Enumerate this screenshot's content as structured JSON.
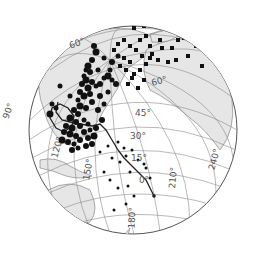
{
  "map": {
    "projection": "orthographic",
    "colors": {
      "background": "#ffffff",
      "ocean": "#ffffff",
      "land": "#e6e6e6",
      "coast": "#777777",
      "graticule": "#8a8a8a",
      "rim": "#555555",
      "points": "#111111",
      "track": "#222222",
      "label": "#555555"
    },
    "latitude_labels": [
      {
        "text": "60°",
        "x": 78,
        "y": 46,
        "rot": -20
      },
      {
        "text": "60°",
        "x": 160,
        "y": 84,
        "rot": -15
      },
      {
        "text": "45°",
        "x": 143,
        "y": 116,
        "rot": 0
      },
      {
        "text": "30°",
        "x": 138,
        "y": 139,
        "rot": 0
      },
      {
        "text": "15°",
        "x": 139,
        "y": 161,
        "rot": 0
      },
      {
        "text": "0°",
        "x": 144,
        "y": 183,
        "rot": 0
      }
    ],
    "longitude_labels": [
      {
        "text": "90°",
        "x": 11,
        "y": 112,
        "rot": -70
      },
      {
        "text": "120°",
        "x": 60,
        "y": 148,
        "rot": -75
      },
      {
        "text": "150°",
        "x": 91,
        "y": 170,
        "rot": -80
      },
      {
        "text": "180°",
        "x": 135,
        "y": 218,
        "rot": -88
      },
      {
        "text": "210°",
        "x": 176,
        "y": 178,
        "rot": -85
      },
      {
        "text": "240°",
        "x": 217,
        "y": 160,
        "rot": -75
      }
    ],
    "circle_points": [
      [
        94,
        46,
        3
      ],
      [
        96,
        52,
        3.5
      ],
      [
        92,
        60,
        3
      ],
      [
        88,
        66,
        3.5
      ],
      [
        86,
        70,
        2.5
      ],
      [
        90,
        72,
        3
      ],
      [
        84,
        76,
        2.5
      ],
      [
        86,
        80,
        3.5
      ],
      [
        92,
        82,
        3
      ],
      [
        82,
        84,
        3
      ],
      [
        88,
        88,
        3.5
      ],
      [
        96,
        86,
        2.5
      ],
      [
        80,
        92,
        3
      ],
      [
        84,
        96,
        3.5
      ],
      [
        90,
        94,
        3
      ],
      [
        92,
        102,
        3
      ],
      [
        78,
        100,
        2.5
      ],
      [
        80,
        106,
        3.5
      ],
      [
        86,
        108,
        3
      ],
      [
        74,
        110,
        3
      ],
      [
        78,
        114,
        3
      ],
      [
        70,
        118,
        3.5
      ],
      [
        76,
        122,
        3
      ],
      [
        84,
        120,
        2.5
      ],
      [
        66,
        126,
        3
      ],
      [
        72,
        128,
        3.5
      ],
      [
        80,
        126,
        3
      ],
      [
        88,
        124,
        2.5
      ],
      [
        64,
        132,
        3
      ],
      [
        70,
        134,
        3.5
      ],
      [
        76,
        136,
        3
      ],
      [
        84,
        132,
        3
      ],
      [
        90,
        130,
        2.5
      ],
      [
        96,
        128,
        3
      ],
      [
        62,
        140,
        3.5
      ],
      [
        68,
        142,
        3
      ],
      [
        74,
        144,
        2.5
      ],
      [
        80,
        140,
        3
      ],
      [
        88,
        138,
        3
      ],
      [
        94,
        136,
        3.5
      ],
      [
        72,
        150,
        3
      ],
      [
        78,
        148,
        2.5
      ],
      [
        86,
        146,
        3
      ],
      [
        92,
        144,
        3
      ],
      [
        52,
        104,
        2.5
      ],
      [
        50,
        114,
        3.5
      ],
      [
        56,
        108,
        2.5
      ],
      [
        100,
        84,
        3
      ],
      [
        104,
        78,
        2.5
      ],
      [
        108,
        76,
        3.5
      ],
      [
        112,
        80,
        2.5
      ],
      [
        116,
        84,
        3
      ],
      [
        108,
        92,
        2.5
      ],
      [
        100,
        96,
        3
      ],
      [
        104,
        104,
        2.5
      ],
      [
        98,
        110,
        3
      ],
      [
        110,
        70,
        2.5
      ],
      [
        112,
        62,
        3
      ],
      [
        118,
        56,
        2.5
      ],
      [
        104,
        58,
        2.5
      ],
      [
        60,
        86,
        2.5
      ],
      [
        98,
        70,
        2.5
      ],
      [
        70,
        96,
        2.5
      ],
      [
        102,
        120,
        3
      ]
    ],
    "square_points": [
      [
        136,
        20
      ],
      [
        140,
        24
      ],
      [
        134,
        28
      ],
      [
        144,
        26
      ],
      [
        168,
        22
      ],
      [
        178,
        40
      ],
      [
        184,
        38
      ],
      [
        172,
        48
      ],
      [
        196,
        46
      ],
      [
        200,
        42
      ],
      [
        142,
        56
      ],
      [
        150,
        58
      ],
      [
        158,
        60
      ],
      [
        168,
        62
      ],
      [
        176,
        60
      ],
      [
        188,
        56
      ],
      [
        202,
        66
      ],
      [
        124,
        58
      ],
      [
        130,
        62
      ],
      [
        126,
        70
      ],
      [
        134,
        74
      ],
      [
        140,
        70
      ],
      [
        144,
        80
      ],
      [
        138,
        88
      ],
      [
        128,
        84
      ],
      [
        132,
        78
      ],
      [
        146,
        64
      ],
      [
        152,
        54
      ],
      [
        118,
        44
      ],
      [
        124,
        40
      ],
      [
        162,
        48
      ],
      [
        160,
        40
      ],
      [
        130,
        46
      ],
      [
        136,
        50
      ],
      [
        150,
        46
      ],
      [
        114,
        50
      ],
      [
        120,
        66
      ],
      [
        140,
        40
      ],
      [
        146,
        36
      ],
      [
        212,
        30
      ]
    ],
    "small_points": [
      [
        118,
        142
      ],
      [
        124,
        148
      ],
      [
        132,
        150
      ],
      [
        126,
        156
      ],
      [
        138,
        160
      ],
      [
        144,
        164
      ],
      [
        112,
        158
      ],
      [
        120,
        162
      ],
      [
        130,
        172
      ],
      [
        146,
        168
      ],
      [
        150,
        178
      ],
      [
        104,
        172
      ],
      [
        110,
        180
      ],
      [
        118,
        188
      ],
      [
        128,
        186
      ],
      [
        134,
        196
      ],
      [
        126,
        204
      ],
      [
        114,
        210
      ],
      [
        108,
        146
      ],
      [
        100,
        152
      ]
    ],
    "track": [
      [
        58,
        102
      ],
      [
        56,
        112
      ],
      [
        62,
        120
      ],
      [
        70,
        122
      ],
      [
        80,
        124
      ],
      [
        92,
        126
      ],
      [
        100,
        124
      ],
      [
        106,
        130
      ],
      [
        112,
        140
      ],
      [
        118,
        150
      ],
      [
        124,
        158
      ],
      [
        132,
        166
      ],
      [
        140,
        174
      ],
      [
        146,
        180
      ],
      [
        150,
        188
      ],
      [
        154,
        196
      ]
    ],
    "loop_track": [
      [
        56,
        128
      ],
      [
        50,
        118
      ],
      [
        52,
        108
      ],
      [
        60,
        104
      ],
      [
        68,
        108
      ],
      [
        74,
        116
      ],
      [
        72,
        126
      ],
      [
        64,
        132
      ],
      [
        56,
        128
      ]
    ]
  }
}
